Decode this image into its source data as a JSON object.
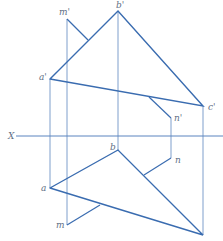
{
  "diagram": {
    "axis_label": "X",
    "labels": {
      "m_prime": "m'",
      "b_prime": "b'",
      "a_prime": "a'",
      "c_prime": "c'",
      "n_prime": "n'",
      "b": "b",
      "n": "n",
      "a": "a",
      "m": "m"
    },
    "colors": {
      "line": "#3a6cb0",
      "projection": "#7f9fcc",
      "label": "#5f6f85"
    }
  }
}
